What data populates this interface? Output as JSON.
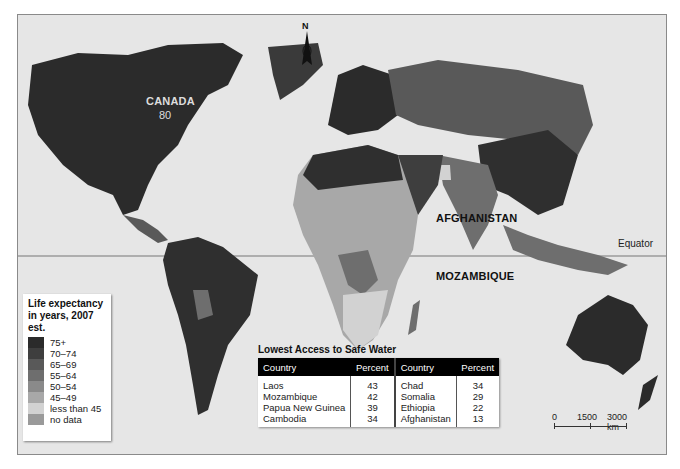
{
  "map": {
    "equator_label": "Equator",
    "compass_label": "N",
    "country_labels": {
      "canada": "CANADA",
      "canada_value": "80",
      "afghanistan": "AFGHANISTAN",
      "mozambique": "MOZAMBIQUE"
    }
  },
  "legend": {
    "title": "Life expectancy in years, 2007 est.",
    "items": [
      {
        "label": "75+",
        "color": "#2b2b2b"
      },
      {
        "label": "70–74",
        "color": "#3e3e3e"
      },
      {
        "label": "65–69",
        "color": "#595959"
      },
      {
        "label": "55–64",
        "color": "#6e6e6e"
      },
      {
        "label": "50–54",
        "color": "#8a8a8a"
      },
      {
        "label": "45–49",
        "color": "#a8a8a8"
      },
      {
        "label": "less than 45",
        "color": "#d2d2d2"
      },
      {
        "label": "no data",
        "color": "#9a9a9a"
      }
    ]
  },
  "safe_water_table": {
    "title": "Lowest Access to Safe Water",
    "headers": [
      "Country",
      "Percent",
      "Country",
      "Percent"
    ],
    "left": [
      {
        "country": "Laos",
        "percent": "43"
      },
      {
        "country": "Mozambique",
        "percent": "42"
      },
      {
        "country": "Papua New Guinea",
        "percent": "39"
      },
      {
        "country": "Cambodia",
        "percent": "34"
      }
    ],
    "right": [
      {
        "country": "Chad",
        "percent": "34"
      },
      {
        "country": "Somalia",
        "percent": "29"
      },
      {
        "country": "Ethiopia",
        "percent": "22"
      },
      {
        "country": "Afghanistan",
        "percent": "13"
      }
    ]
  },
  "scale_bar": {
    "labels": [
      "0",
      "1500",
      "3000 km"
    ]
  }
}
